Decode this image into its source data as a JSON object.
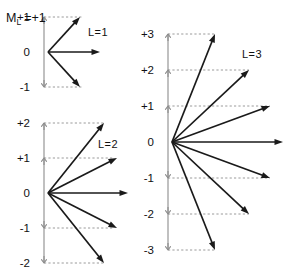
{
  "figure": {
    "title_symbol": "M",
    "title_subscript": "L",
    "title_value": "=+1",
    "colors": {
      "vector": "#1a1a1a",
      "axis": "#8c8c8c",
      "projection": "#9a9a9a",
      "background": "#ffffff",
      "text": "#111111"
    }
  },
  "chart_data": {
    "type": "scatter",
    "title": "",
    "xlabel": "",
    "ylabel": "M_L",
    "panels": [
      {
        "id": "L1",
        "label": "L=1",
        "L": 1,
        "origin": [
          48,
          52
        ],
        "unit": 35,
        "radius": 46,
        "axis_top": 17,
        "axis_bottom": 87,
        "ml_values": [
          1,
          0,
          -1
        ],
        "ml_labels": [
          "+1",
          "0",
          "-1"
        ],
        "label_x": 30,
        "panel_label_x": 88,
        "panel_label_y": 36,
        "vectors": [
          {
            "ml": 1,
            "tip": [
              80,
              17
            ]
          },
          {
            "ml": 0,
            "tip": [
              100,
              52
            ]
          },
          {
            "ml": -1,
            "tip": [
              80,
              87
            ]
          }
        ],
        "proj_lines": [
          {
            "ml": 1,
            "x1": 44,
            "x2": 83,
            "y": 17
          },
          {
            "ml": -1,
            "x1": 44,
            "x2": 83,
            "y": 87
          }
        ]
      },
      {
        "id": "L2",
        "label": "L=2",
        "L": 2,
        "origin": [
          48,
          193
        ],
        "unit": 35,
        "radius": 76,
        "axis_top": 123,
        "axis_bottom": 263,
        "ml_values": [
          2,
          1,
          0,
          -1,
          -2
        ],
        "ml_labels": [
          "+2",
          "+1",
          "0",
          "-1",
          "-2"
        ],
        "label_x": 30,
        "panel_label_x": 98,
        "panel_label_y": 148,
        "vectors": [
          {
            "ml": 2,
            "tip": [
              104,
              123
            ]
          },
          {
            "ml": 1,
            "tip": [
              117,
              158
            ]
          },
          {
            "ml": 0,
            "tip": [
              128,
              193
            ]
          },
          {
            "ml": -1,
            "tip": [
              117,
              228
            ]
          },
          {
            "ml": -2,
            "tip": [
              104,
              263
            ]
          }
        ],
        "proj_lines": [
          {
            "ml": 2,
            "x1": 44,
            "x2": 104,
            "y": 123
          },
          {
            "ml": 1,
            "x1": 44,
            "x2": 114,
            "y": 158
          },
          {
            "ml": -1,
            "x1": 44,
            "x2": 114,
            "y": 228
          },
          {
            "ml": -2,
            "x1": 44,
            "x2": 104,
            "y": 263
          }
        ]
      },
      {
        "id": "L3",
        "label": "L=3",
        "L": 3,
        "origin": [
          172,
          142
        ],
        "unit": 36,
        "radius": 116,
        "axis_top": 34,
        "axis_bottom": 250,
        "ml_values": [
          3,
          2,
          1,
          0,
          -1,
          -2,
          -3
        ],
        "ml_labels": [
          "+3",
          "+2",
          "+1",
          "0",
          "-1",
          "-2",
          "-3"
        ],
        "label_x": 154,
        "panel_label_x": 242,
        "panel_label_y": 58,
        "vectors": [
          {
            "ml": 3,
            "tip": [
              215,
              34
            ]
          },
          {
            "ml": 2,
            "tip": [
              249,
              70
            ]
          },
          {
            "ml": 1,
            "tip": [
              270,
              106
            ]
          },
          {
            "ml": 0,
            "tip": [
              283,
              142
            ]
          },
          {
            "ml": -1,
            "tip": [
              270,
              178
            ]
          },
          {
            "ml": -2,
            "tip": [
              249,
              214
            ]
          },
          {
            "ml": -3,
            "tip": [
              215,
              250
            ]
          }
        ],
        "proj_lines": [
          {
            "ml": 3,
            "x1": 168,
            "x2": 215,
            "y": 34
          },
          {
            "ml": 2,
            "x1": 168,
            "x2": 249,
            "y": 70
          },
          {
            "ml": 1,
            "x1": 168,
            "x2": 270,
            "y": 106
          },
          {
            "ml": -1,
            "x1": 168,
            "x2": 270,
            "y": 178
          },
          {
            "ml": -2,
            "x1": 168,
            "x2": 249,
            "y": 214
          },
          {
            "ml": -3,
            "x1": 168,
            "x2": 215,
            "y": 250
          }
        ]
      }
    ]
  }
}
